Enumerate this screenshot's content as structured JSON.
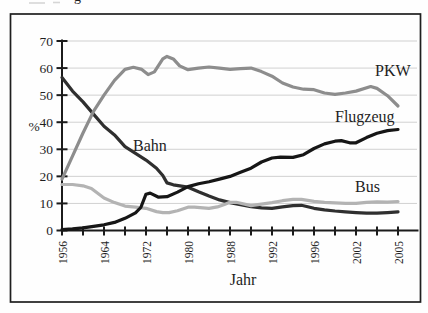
{
  "page": {
    "caption_fragment": "g"
  },
  "chart_data": {
    "type": "line",
    "title": "",
    "xlabel": "Jahr",
    "ylabel": "%",
    "ylim": [
      0,
      70
    ],
    "ytick_step": 10,
    "ytick_labels": [
      "0",
      "10",
      "20",
      "30",
      "40",
      "50",
      "60",
      "70"
    ],
    "xtick_labels": [
      "1956",
      "",
      "1964",
      "",
      "1972",
      "",
      "1980",
      "",
      "1988",
      "",
      "1992",
      "",
      "1996",
      "",
      "2002",
      "",
      "2005"
    ],
    "x_axis_style": "evenly spaced category ticks, year labels rotated 90 degrees",
    "grid": "horizontal light gridlines every 10 units",
    "legend_position": "inline labels next to lines",
    "frame_color": "#1f1f1f",
    "axis_color": "#1b1b1b",
    "grid_color": "#cccccc",
    "text_color": "#1f1f1f",
    "series": [
      {
        "name": "Bahn",
        "color": "#2f2f2f",
        "label_anchor_px": [
          133,
          151
        ],
        "values_at_ticks": [
          56.5,
          47.5,
          38.5,
          31,
          26,
          17.6,
          16,
          12.7,
          10.3,
          8.8,
          8.2,
          9.2,
          8.2,
          7.2,
          6.6,
          6.4,
          6.9
        ],
        "points": [
          [
            0,
            56.5
          ],
          [
            0.5,
            51.5
          ],
          [
            1,
            47.5
          ],
          [
            1.5,
            43
          ],
          [
            2,
            38.5
          ],
          [
            2.5,
            35.3
          ],
          [
            3,
            31
          ],
          [
            3.5,
            28.5
          ],
          [
            4,
            26
          ],
          [
            4.5,
            23
          ],
          [
            4.8,
            20.3
          ],
          [
            5,
            17.6
          ],
          [
            5.3,
            16.9
          ],
          [
            6,
            16
          ],
          [
            6.5,
            14.3
          ],
          [
            7,
            12.7
          ],
          [
            7.5,
            11.3
          ],
          [
            8,
            10.3
          ],
          [
            8.5,
            9.5
          ],
          [
            9,
            8.8
          ],
          [
            9.5,
            8.4
          ],
          [
            10,
            8.2
          ],
          [
            10.5,
            8.7
          ],
          [
            11,
            9.2
          ],
          [
            11.4,
            9.3
          ],
          [
            12,
            8.2
          ],
          [
            12.5,
            7.6
          ],
          [
            13,
            7.2
          ],
          [
            13.5,
            6.9
          ],
          [
            14,
            6.6
          ],
          [
            14.5,
            6.4
          ],
          [
            15,
            6.4
          ],
          [
            15.5,
            6.6
          ],
          [
            16,
            6.9
          ]
        ]
      },
      {
        "name": "Bus",
        "color": "#b3b3b3",
        "label_anchor_px": [
          355,
          192
        ],
        "values_at_ticks": [
          17,
          16.5,
          12,
          9,
          8.2,
          6.6,
          8.6,
          8.2,
          10.4,
          9.2,
          10.3,
          11.5,
          10.8,
          10.2,
          10,
          10.6,
          10.7
        ],
        "points": [
          [
            0,
            17
          ],
          [
            0.5,
            17
          ],
          [
            1,
            16.5
          ],
          [
            1.4,
            15.5
          ],
          [
            2,
            12
          ],
          [
            2.5,
            10.3
          ],
          [
            3,
            9
          ],
          [
            3.5,
            8.6
          ],
          [
            4,
            8.2
          ],
          [
            4.5,
            7
          ],
          [
            4.8,
            6.6
          ],
          [
            5.1,
            6.6
          ],
          [
            5.5,
            7.3
          ],
          [
            6,
            8.6
          ],
          [
            6.3,
            8.6
          ],
          [
            7,
            8.2
          ],
          [
            7.4,
            8.7
          ],
          [
            7.7,
            9.5
          ],
          [
            8,
            10.4
          ],
          [
            8.3,
            10.4
          ],
          [
            9,
            9.2
          ],
          [
            9.5,
            9.7
          ],
          [
            10,
            10.3
          ],
          [
            10.5,
            11
          ],
          [
            11,
            11.5
          ],
          [
            11.4,
            11.5
          ],
          [
            12,
            10.8
          ],
          [
            12.5,
            10.4
          ],
          [
            13,
            10.2
          ],
          [
            13.5,
            10
          ],
          [
            14,
            10
          ],
          [
            14.5,
            10.4
          ],
          [
            15,
            10.6
          ],
          [
            15.5,
            10.5
          ],
          [
            16,
            10.7
          ]
        ]
      },
      {
        "name": "PKW",
        "color": "#8d8d8d",
        "label_anchor_px": [
          375,
          76
        ],
        "values_at_ticks": [
          19,
          36,
          50,
          59.5,
          57.5,
          64.3,
          59.4,
          60.4,
          59.5,
          60,
          57,
          53,
          52,
          50.3,
          51.5,
          52.5,
          46
        ],
        "points": [
          [
            0,
            19
          ],
          [
            0.5,
            27.5
          ],
          [
            1,
            36
          ],
          [
            1.5,
            44
          ],
          [
            2,
            50
          ],
          [
            2.5,
            55.5
          ],
          [
            3,
            59.5
          ],
          [
            3.4,
            60.3
          ],
          [
            3.8,
            59.5
          ],
          [
            4.1,
            57.6
          ],
          [
            4.4,
            58.6
          ],
          [
            4.8,
            63.4
          ],
          [
            5,
            64.3
          ],
          [
            5.3,
            63.4
          ],
          [
            5.6,
            60.8
          ],
          [
            6,
            59.4
          ],
          [
            6.5,
            60
          ],
          [
            7,
            60.4
          ],
          [
            7.5,
            60
          ],
          [
            8,
            59.5
          ],
          [
            8.5,
            59.8
          ],
          [
            9,
            60
          ],
          [
            9.5,
            58.7
          ],
          [
            10,
            57
          ],
          [
            10.5,
            54.5
          ],
          [
            11,
            53
          ],
          [
            11.5,
            52.2
          ],
          [
            12,
            52
          ],
          [
            12.5,
            50.8
          ],
          [
            13,
            50.3
          ],
          [
            13.5,
            50.8
          ],
          [
            14,
            51.5
          ],
          [
            14.7,
            53.2
          ],
          [
            15,
            52.5
          ],
          [
            15.5,
            49.8
          ],
          [
            16,
            46
          ]
        ]
      },
      {
        "name": "Flugzeug",
        "color": "#161616",
        "label_anchor_px": [
          335,
          122
        ],
        "values_at_ticks": [
          0.3,
          1,
          2.1,
          4.5,
          13.4,
          12.5,
          16.2,
          18,
          20,
          23,
          26.8,
          27,
          30.3,
          33,
          32.4,
          35.9,
          37.3
        ],
        "points": [
          [
            0,
            0.3
          ],
          [
            0.5,
            0.6
          ],
          [
            1,
            1
          ],
          [
            1.5,
            1.5
          ],
          [
            2,
            2.1
          ],
          [
            2.5,
            3
          ],
          [
            3,
            4.5
          ],
          [
            3.5,
            6.5
          ],
          [
            3.75,
            8.5
          ],
          [
            4,
            13.4
          ],
          [
            4.2,
            13.8
          ],
          [
            4.6,
            12.3
          ],
          [
            5,
            12.5
          ],
          [
            5.5,
            14.2
          ],
          [
            6,
            16.2
          ],
          [
            6.5,
            17.3
          ],
          [
            7,
            18
          ],
          [
            7.5,
            19
          ],
          [
            8,
            20
          ],
          [
            8.5,
            21.5
          ],
          [
            9,
            23
          ],
          [
            9.5,
            25.3
          ],
          [
            10,
            26.8
          ],
          [
            10.4,
            27.1
          ],
          [
            11,
            27
          ],
          [
            11.5,
            28
          ],
          [
            12,
            30.3
          ],
          [
            12.5,
            32
          ],
          [
            13,
            33
          ],
          [
            13.3,
            33.2
          ],
          [
            13.7,
            32.4
          ],
          [
            14,
            32.4
          ],
          [
            14.5,
            34.3
          ],
          [
            15,
            35.9
          ],
          [
            15.5,
            36.9
          ],
          [
            16,
            37.3
          ]
        ]
      }
    ]
  }
}
